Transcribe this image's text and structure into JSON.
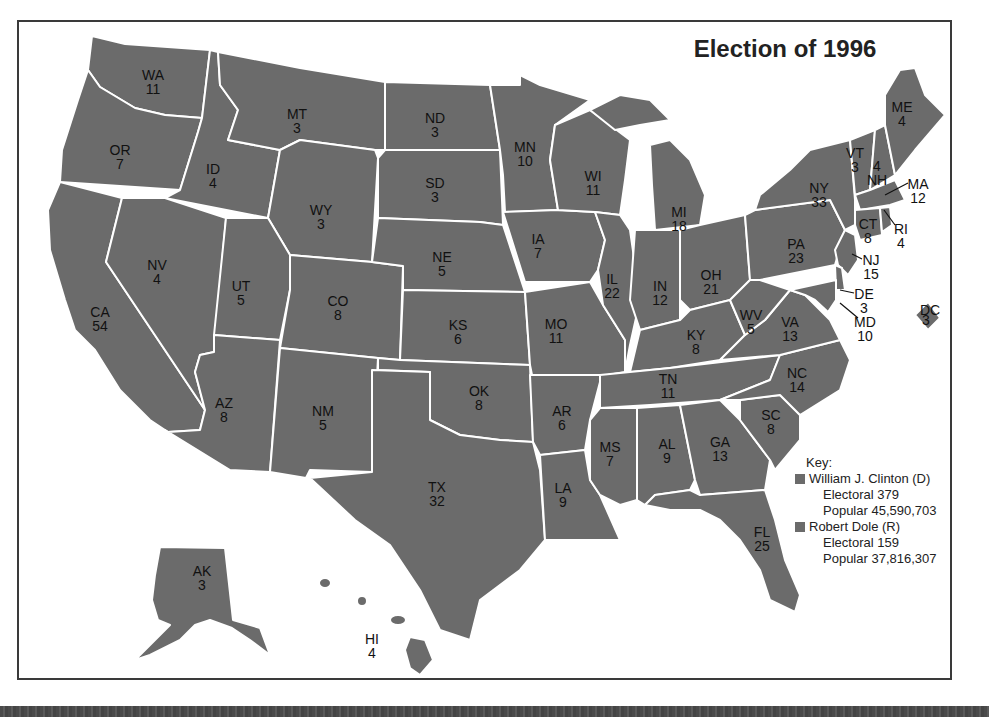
{
  "title": "Election of 1996",
  "colors": {
    "state_fill": "#6b6b6b",
    "state_border": "#ffffff",
    "frame_border": "#3a3a3a",
    "clinton_swatch": "#6b6b6b",
    "dole_swatch": "#6b6b6b"
  },
  "key": {
    "heading": "Key:",
    "candidates": [
      {
        "name": "William J. Clinton (D)",
        "electoral": "Electoral 379",
        "popular": "Popular 45,590,703"
      },
      {
        "name": "Robert Dole (R)",
        "electoral": "Electoral 159",
        "popular": "Popular 37,816,307"
      }
    ]
  },
  "states": {
    "WA": {
      "abbr": "WA",
      "votes": "11"
    },
    "OR": {
      "abbr": "OR",
      "votes": "7"
    },
    "CA": {
      "abbr": "CA",
      "votes": "54"
    },
    "ID": {
      "abbr": "ID",
      "votes": "4"
    },
    "NV": {
      "abbr": "NV",
      "votes": "4"
    },
    "MT": {
      "abbr": "MT",
      "votes": "3"
    },
    "WY": {
      "abbr": "WY",
      "votes": "3"
    },
    "UT": {
      "abbr": "UT",
      "votes": "5"
    },
    "AZ": {
      "abbr": "AZ",
      "votes": "8"
    },
    "CO": {
      "abbr": "CO",
      "votes": "8"
    },
    "NM": {
      "abbr": "NM",
      "votes": "5"
    },
    "ND": {
      "abbr": "ND",
      "votes": "3"
    },
    "SD": {
      "abbr": "SD",
      "votes": "3"
    },
    "NE": {
      "abbr": "NE",
      "votes": "5"
    },
    "KS": {
      "abbr": "KS",
      "votes": "6"
    },
    "OK": {
      "abbr": "OK",
      "votes": "8"
    },
    "TX": {
      "abbr": "TX",
      "votes": "32"
    },
    "MN": {
      "abbr": "MN",
      "votes": "10"
    },
    "IA": {
      "abbr": "IA",
      "votes": "7"
    },
    "MO": {
      "abbr": "MO",
      "votes": "11"
    },
    "AR": {
      "abbr": "AR",
      "votes": "6"
    },
    "LA": {
      "abbr": "LA",
      "votes": "9"
    },
    "WI": {
      "abbr": "WI",
      "votes": "11"
    },
    "IL": {
      "abbr": "IL",
      "votes": "22"
    },
    "MI": {
      "abbr": "MI",
      "votes": "18"
    },
    "IN": {
      "abbr": "IN",
      "votes": "12"
    },
    "OH": {
      "abbr": "OH",
      "votes": "21"
    },
    "KY": {
      "abbr": "KY",
      "votes": "8"
    },
    "TN": {
      "abbr": "TN",
      "votes": "11"
    },
    "MS": {
      "abbr": "MS",
      "votes": "7"
    },
    "AL": {
      "abbr": "AL",
      "votes": "9"
    },
    "GA": {
      "abbr": "GA",
      "votes": "13"
    },
    "FL": {
      "abbr": "FL",
      "votes": "25"
    },
    "SC": {
      "abbr": "SC",
      "votes": "8"
    },
    "NC": {
      "abbr": "NC",
      "votes": "14"
    },
    "VA": {
      "abbr": "VA",
      "votes": "13"
    },
    "WV": {
      "abbr": "WV",
      "votes": "5"
    },
    "PA": {
      "abbr": "PA",
      "votes": "23"
    },
    "NY": {
      "abbr": "NY",
      "votes": "33"
    },
    "VT": {
      "abbr": "VT",
      "votes": "3"
    },
    "NH": {
      "abbr": "NH",
      "votes": "4"
    },
    "ME": {
      "abbr": "ME",
      "votes": "4"
    },
    "MA": {
      "abbr": "MA",
      "votes": "12"
    },
    "RI": {
      "abbr": "RI",
      "votes": "4"
    },
    "CT": {
      "abbr": "CT",
      "votes": "8"
    },
    "NJ": {
      "abbr": "NJ",
      "votes": "15"
    },
    "DE": {
      "abbr": "DE",
      "votes": "3"
    },
    "MD": {
      "abbr": "MD",
      "votes": "10"
    },
    "DC": {
      "abbr": "DC",
      "votes": "3"
    },
    "AK": {
      "abbr": "AK",
      "votes": "3"
    },
    "HI": {
      "abbr": "HI",
      "votes": "4"
    }
  }
}
